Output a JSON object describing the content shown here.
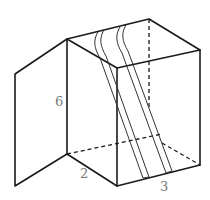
{
  "diagram": {
    "type": "3d-box-with-open-lid",
    "labels": {
      "height": "6",
      "width": "2",
      "depth": "3"
    },
    "colors": {
      "line": "#1a1a1a",
      "label": "#777777",
      "background": "#ffffff"
    }
  }
}
